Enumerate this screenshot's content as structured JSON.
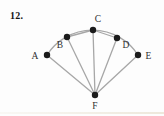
{
  "problem_number": "12.",
  "figure": {
    "type": "geometry-diagram",
    "points": {
      "A": "A",
      "B": "B",
      "C": "C",
      "D": "D",
      "E": "E",
      "F": "F"
    },
    "edges": [
      "FA",
      "FB",
      "FC",
      "FD",
      "FE",
      "CB",
      "CD"
    ],
    "arc": "arc from A through C to E",
    "colors": {
      "line": "#a7a7a7",
      "dot": "#1b1b1b",
      "label": "#2e2e2e",
      "background": "#fdfdfd"
    }
  }
}
